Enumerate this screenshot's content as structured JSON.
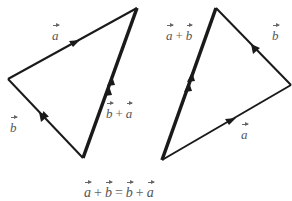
{
  "diagram": {
    "left_triangle": {
      "vertices": {
        "left": [
          8,
          79
        ],
        "top": [
          137,
          8
        ],
        "bottom": [
          83,
          158
        ]
      },
      "labels": {
        "a": {
          "text": "a",
          "x": 52,
          "y": 26
        },
        "b": {
          "text": "b",
          "x": 10,
          "y": 118
        },
        "sum": {
          "lhs": "b",
          "op": "+",
          "rhs": "a",
          "x": 106,
          "y": 105
        }
      }
    },
    "right_triangle": {
      "vertices": {
        "top": [
          216,
          8
        ],
        "right": [
          291,
          85
        ],
        "bottom": [
          162,
          160
        ]
      },
      "labels": {
        "a": {
          "text": "a",
          "x": 241,
          "y": 125
        },
        "b": {
          "text": "b",
          "x": 271,
          "y": 26
        },
        "sum": {
          "lhs": "a",
          "op": "+",
          "rhs": "b",
          "x": 166,
          "y": 26
        }
      }
    },
    "equation": {
      "t1": "a",
      "op1": "+",
      "t2": "b",
      "eq": "=",
      "t3": "b",
      "op2": "+",
      "t4": "a"
    },
    "colors": {
      "stroke": "#1a1a1a",
      "label": "#555555"
    }
  }
}
